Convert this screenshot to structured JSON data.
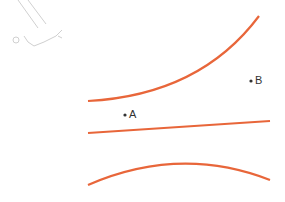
{
  "diagram": {
    "curve_color": "#e8663a",
    "point_color": "#333333",
    "faint_sketch_color": "#cccccc",
    "points": [
      {
        "label": "A",
        "x": 125,
        "y": 115
      },
      {
        "label": "B",
        "x": 251,
        "y": 81
      }
    ],
    "curves": [
      {
        "name": "upper-curve",
        "path": "M 88 101 Q 200 95 259 16"
      },
      {
        "name": "middle-line",
        "path": "M 88 133 L 270 121"
      },
      {
        "name": "lower-curve",
        "path": "M 88 185 Q 180 145 270 180"
      }
    ]
  }
}
